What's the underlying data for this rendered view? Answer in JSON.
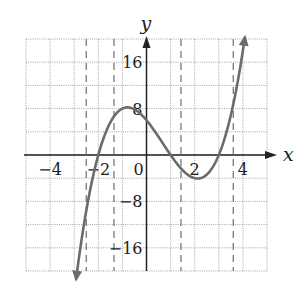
{
  "chart_data": {
    "type": "line",
    "title": "",
    "xlabel": "x",
    "ylabel": "y",
    "xlim": [
      -5,
      5
    ],
    "ylim": [
      -20,
      20
    ],
    "grid": true,
    "x_gridline_step": 1,
    "y_gridline_step": 4,
    "x_tick_labels": [
      {
        "value": -4,
        "label": "−4"
      },
      {
        "value": -2,
        "label": "−2"
      },
      {
        "value": 0,
        "label": "0"
      },
      {
        "value": 2,
        "label": "2"
      },
      {
        "value": 4,
        "label": "4"
      }
    ],
    "y_tick_labels": [
      {
        "value": 16,
        "label": "16"
      },
      {
        "value": 8,
        "label": "8"
      },
      {
        "value": -8,
        "label": "−8"
      },
      {
        "value": -16,
        "label": "−16"
      }
    ],
    "dashed_vertical_lines": [
      -2.5,
      -1.35,
      1.43,
      3.6
    ],
    "series": [
      {
        "name": "f(x)",
        "function": "(x+2)(x-1)(x-3)",
        "coefficients_desc": [
          1,
          -2,
          -5,
          6
        ],
        "x_range": [
          -2.92,
          4.08
        ],
        "arrows_at_ends": true,
        "color": "#6b6b6b",
        "key_points": {
          "x_intercepts": [
            -2,
            1,
            3
          ],
          "y_intercept": 6,
          "local_max": [
            -0.79,
            8.2
          ],
          "local_min": [
            2.12,
            -4.06
          ]
        },
        "x": [
          -2.9,
          -2.5,
          -2,
          -1.5,
          -1,
          -0.79,
          -0.5,
          0,
          0.5,
          1,
          1.5,
          2,
          2.12,
          2.5,
          3,
          3.5,
          4
        ],
        "y": [
          -19.9,
          -8.6,
          0,
          5.6,
          8,
          8.2,
          7.9,
          6,
          3.1,
          0,
          -2.6,
          -4,
          -4.06,
          -3.4,
          0,
          6.9,
          18
        ]
      }
    ]
  }
}
